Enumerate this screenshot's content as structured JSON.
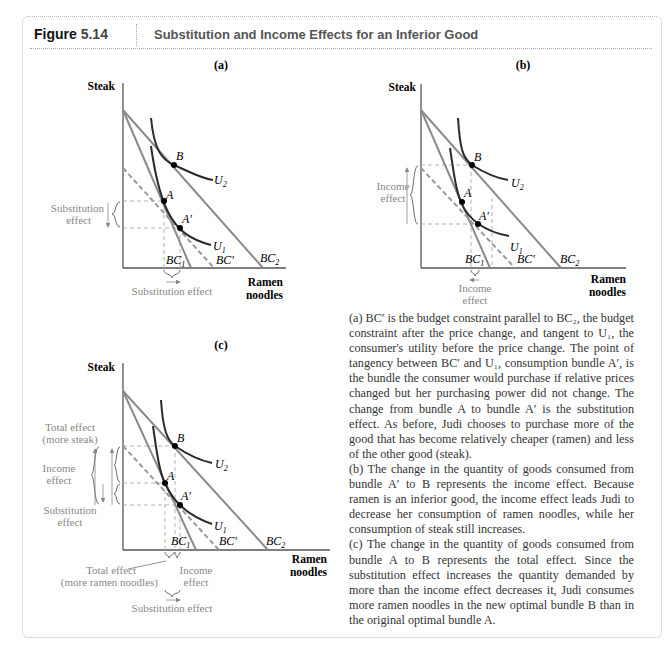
{
  "header": {
    "figure_word": "Figure",
    "figure_number": "5.14",
    "title": "Substitution and Income Effects for an Inferior Good"
  },
  "panels": {
    "a": {
      "label": "(a)",
      "y_axis": "Steak",
      "x_axis_line1": "Ramen",
      "x_axis_line2": "noodles",
      "points": [
        "B",
        "A",
        "A′"
      ],
      "curves": [
        "U2",
        "U1"
      ],
      "constraints": [
        "BC1",
        "BC′",
        "BC2"
      ],
      "annotations": {
        "left_line1": "Substitution",
        "left_line2": "effect",
        "bottom": "Substitution effect"
      }
    },
    "b": {
      "label": "(b)",
      "y_axis": "Steak",
      "x_axis_line1": "Ramen",
      "x_axis_line2": "noodles",
      "points": [
        "B",
        "A",
        "A′"
      ],
      "curves": [
        "U2",
        "U1"
      ],
      "constraints": [
        "BC1",
        "BC′",
        "BC2"
      ],
      "annotations": {
        "left_line1": "Income",
        "left_line2": "effect",
        "bottom_line1": "Income",
        "bottom_line2": "effect"
      }
    },
    "c": {
      "label": "(c)",
      "y_axis": "Steak",
      "x_axis_line1": "Ramen",
      "x_axis_line2": "noodles",
      "points": [
        "B",
        "A",
        "A′"
      ],
      "curves": [
        "U2",
        "U1"
      ],
      "constraints": [
        "BC1",
        "BC′",
        "BC2"
      ],
      "annotations": {
        "total_line1": "Total effect",
        "total_line2": "(more steak)",
        "income_line1": "Income",
        "income_line2": "effect",
        "subst_line1": "Substitution",
        "subst_line2": "effect",
        "bottom_total_line1": "Total effect",
        "bottom_total_line2": "(more ramen noodles)",
        "bottom_income_line1": "Income",
        "bottom_income_line2": "effect",
        "bottom_subst": "Substitution effect"
      }
    }
  },
  "caption": {
    "a": "(a) BC′ is the budget constraint parallel to BC₂, the budget constraint after the price change, and tangent to U₁, the consumer's utility before the price change. The point of tangency between BC′ and U₁, consumption bundle A′, is the bundle the consumer would purchase if relative prices changed but her purchasing power did not change. The change from bundle A to bundle A′ is the substitution effect. As before, Judi chooses to purchase more of the good that has become relatively cheaper (ramen) and less of the other good (steak).",
    "b": "(b) The change in the quantity of goods consumed from bundle A′ to B represents the income effect. Because ramen is an inferior good, the income effect leads Judi to decrease her consumption of ramen noodles, while her consumption of steak still increases.",
    "c": "(c) The change in the quantity of goods consumed from bundle A to B represents the total effect. Since the substitution effect increases the quantity demanded by more than the income effect decreases it, Judi consumes more ramen noodles in the new optimal bundle B than in the original optimal bundle A."
  },
  "colors": {
    "budget_line": "#8a8a8a",
    "indifference_curve": "#2a2a2a",
    "annotation_text": "#888888",
    "dashed_guide": "#b0b0b0"
  }
}
